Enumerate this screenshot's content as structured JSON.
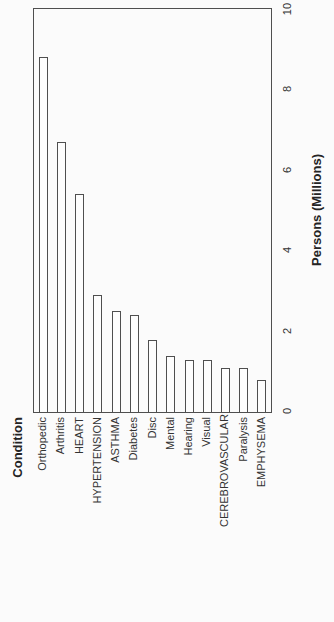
{
  "page": {
    "background_color": "#fbfbfb",
    "line_color": "#4f4f4f",
    "text_color": "#333333",
    "bar_fill_color": "#fdfdfd"
  },
  "chart_data": {
    "type": "bar",
    "orientation_note": "entire chart is rotated 90 degrees counter-clockwise on the portrait page; all text reads bottom-to-top",
    "title": "",
    "xlabel": "Condition",
    "ylabel": "Persons (Millions)",
    "ylim": [
      0,
      10
    ],
    "yticks": [
      0,
      2,
      4,
      6,
      8,
      10
    ],
    "grid": false,
    "legend": "none",
    "bar_style": "white fill, dark outline",
    "categories": [
      "Orthopedic",
      "Arthritis",
      "HEART",
      "HYPERTENSION",
      "ASTHMA",
      "Diabetes",
      "Disc",
      "Mental",
      "Hearing",
      "Visual",
      "CEREBROVASCULAR",
      "Paralysis",
      "EMPHYSEMA"
    ],
    "values": [
      8.8,
      6.7,
      5.4,
      2.9,
      2.5,
      2.4,
      1.8,
      1.4,
      1.3,
      1.3,
      1.1,
      1.1,
      0.8
    ]
  }
}
